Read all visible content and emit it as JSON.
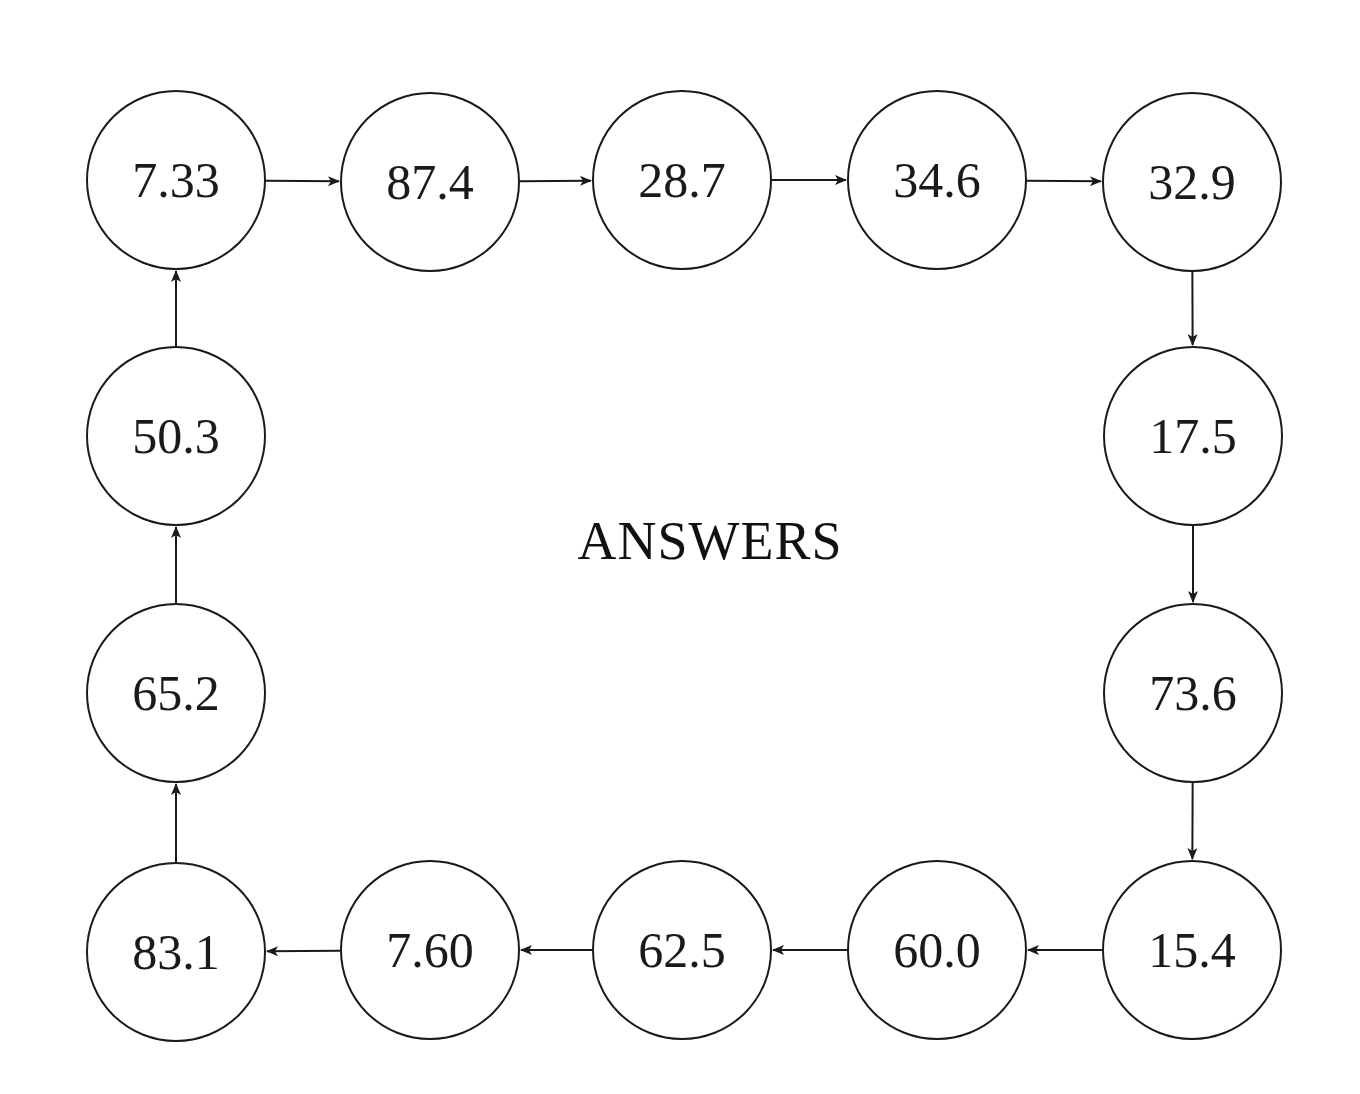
{
  "title": "ANSWERS",
  "colors": {
    "stroke": "#1a1a1a",
    "background": "#ffffff"
  },
  "nodes": [
    {
      "id": "n1",
      "label": "7.33",
      "cx": 176,
      "cy": 180
    },
    {
      "id": "n2",
      "label": "87.4",
      "cx": 430,
      "cy": 182
    },
    {
      "id": "n3",
      "label": "28.7",
      "cx": 682,
      "cy": 180
    },
    {
      "id": "n4",
      "label": "34.6",
      "cx": 937,
      "cy": 180
    },
    {
      "id": "n5",
      "label": "32.9",
      "cx": 1192,
      "cy": 182
    },
    {
      "id": "n6",
      "label": "17.5",
      "cx": 1193,
      "cy": 436
    },
    {
      "id": "n7",
      "label": "73.6",
      "cx": 1193,
      "cy": 693
    },
    {
      "id": "n8",
      "label": "15.4",
      "cx": 1192,
      "cy": 950
    },
    {
      "id": "n9",
      "label": "60.0",
      "cx": 937,
      "cy": 950
    },
    {
      "id": "n10",
      "label": "62.5",
      "cx": 682,
      "cy": 950
    },
    {
      "id": "n11",
      "label": "7.60",
      "cx": 430,
      "cy": 950
    },
    {
      "id": "n12",
      "label": "83.1",
      "cx": 176,
      "cy": 952
    },
    {
      "id": "n13",
      "label": "65.2",
      "cx": 176,
      "cy": 693
    },
    {
      "id": "n14",
      "label": "50.3",
      "cx": 176,
      "cy": 436
    }
  ],
  "edges": [
    {
      "from": "n1",
      "to": "n2"
    },
    {
      "from": "n2",
      "to": "n3"
    },
    {
      "from": "n3",
      "to": "n4"
    },
    {
      "from": "n4",
      "to": "n5"
    },
    {
      "from": "n5",
      "to": "n6"
    },
    {
      "from": "n6",
      "to": "n7"
    },
    {
      "from": "n7",
      "to": "n8"
    },
    {
      "from": "n8",
      "to": "n9"
    },
    {
      "from": "n9",
      "to": "n10"
    },
    {
      "from": "n10",
      "to": "n11"
    },
    {
      "from": "n11",
      "to": "n12"
    },
    {
      "from": "n12",
      "to": "n13"
    },
    {
      "from": "n13",
      "to": "n14"
    },
    {
      "from": "n14",
      "to": "n1"
    }
  ]
}
